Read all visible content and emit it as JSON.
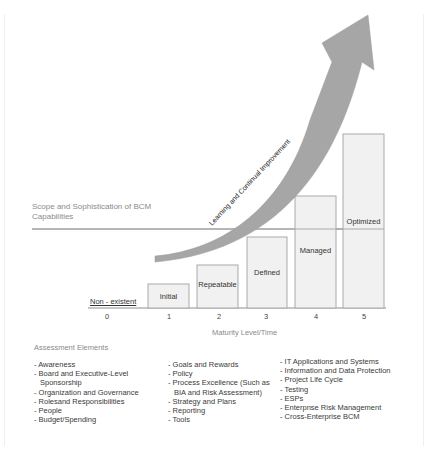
{
  "diagram": {
    "y_axis_label": "Scope and Sophistication of BCM Capabilities",
    "x_axis_label": "Maturity Level/Time",
    "arrow_label": "Learning and Continual Improvement",
    "level0_label": "Non - existent",
    "ticks": [
      "0",
      "1",
      "2",
      "3",
      "4",
      "5"
    ],
    "levels": [
      {
        "level": 1,
        "label": "Initial"
      },
      {
        "level": 2,
        "label": "Repeatable"
      },
      {
        "level": 3,
        "label": "Defined"
      },
      {
        "level": 4,
        "label": "Managed"
      },
      {
        "level": 5,
        "label": "Optimized"
      }
    ],
    "colors": {
      "bar_fill": "#f1f1f1",
      "bar_stroke": "#a9a9a9",
      "arrow": "#a6a6a6",
      "axis_line": "#9e9e9e"
    }
  },
  "assessment": {
    "title": "Assessment Elements",
    "col1": [
      "- Awareness",
      "- Board and Executive-Level",
      "Sponsorship",
      "- Organization and Governance",
      "- Rolesand Responsibilities",
      "- People",
      "- Budget/Spending"
    ],
    "col2": [
      "- Goals and Rewards",
      "- Policy",
      "- Process Excellence (Such as",
      "BIA and Risk Assessment)",
      "- Strategy and Plans",
      "- Reporting",
      "- Tools"
    ],
    "col3": [
      "- IT Applications and Systems",
      "- Information and Data Protection",
      "- Project Life Cycle",
      "- Testing",
      "- ESPs",
      "- Enterpnse Risk Management",
      "- Cross-Enterprise BCM"
    ]
  }
}
